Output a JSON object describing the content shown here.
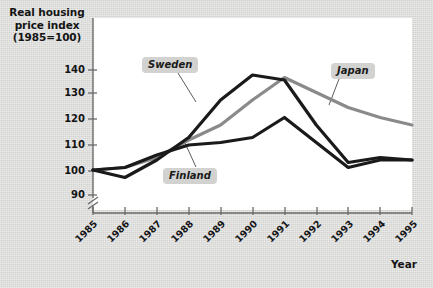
{
  "chart_data": {
    "type": "line",
    "title": "Real housing price index (1985=100)",
    "ylabel_lines": [
      "Real housing",
      "price index",
      "(1985=100)"
    ],
    "xlabel": "Year",
    "categories": [
      "1985",
      "1986",
      "1987",
      "1988",
      "1989",
      "1990",
      "1991",
      "1992",
      "1993",
      "1994",
      "1995"
    ],
    "ytick_labels": [
      "90",
      "100",
      "110",
      "120",
      "130",
      "140"
    ],
    "yticks": [
      90,
      100,
      110,
      120,
      130,
      140
    ],
    "ylim": [
      86,
      145
    ],
    "axis_break": true,
    "grid": false,
    "legend": "inline-labels",
    "series": [
      {
        "name": "Sweden",
        "color": "#1a1a1a",
        "values": [
          100,
          97,
          104,
          113,
          128,
          138,
          136,
          118,
          103,
          105,
          104
        ]
      },
      {
        "name": "Finland",
        "color": "#1a1a1a",
        "values": [
          100,
          101,
          106,
          110,
          111,
          113,
          121,
          111,
          101,
          104,
          104
        ]
      },
      {
        "name": "Japan",
        "color": "#8a8a8a",
        "values": [
          100,
          101,
          105,
          112,
          118,
          128,
          137,
          131,
          125,
          121,
          118
        ]
      }
    ]
  },
  "labels": {
    "sweden": "Sweden",
    "finland": "Finland",
    "japan": "Japan",
    "year": "Year"
  },
  "colors": {
    "page_background": "#d9d9d7",
    "plot_background": "#ffffff",
    "axis": "#6a6a6a",
    "sweden": "#1a1a1a",
    "finland": "#1a1a1a",
    "japan": "#8a8a8a",
    "label_chip": "#d2d2d0"
  }
}
